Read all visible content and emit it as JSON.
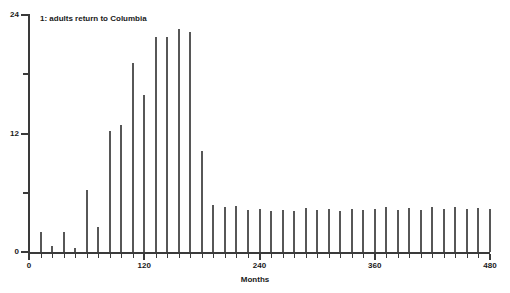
{
  "chart_data": {
    "type": "bar",
    "title": "",
    "annotation": "1: adults return to Columbia",
    "xlabel": "Months",
    "ylabel": "",
    "xlim": [
      0,
      480
    ],
    "ylim": [
      0,
      24
    ],
    "grid": false,
    "legend": null,
    "bar_color": "#575757",
    "axis_color": "#3a3a3a",
    "xticks": [
      0,
      120,
      240,
      360,
      480
    ],
    "xtick_labels": [
      "0",
      "120",
      "240",
      "360",
      "480"
    ],
    "xminor_tick_interval": 12,
    "yticks": [
      0,
      12,
      24
    ],
    "ytick_labels": [
      "0",
      "12",
      "24"
    ],
    "yminor_ticks": [
      6,
      18
    ],
    "x": [
      12,
      24,
      36,
      48,
      60,
      72,
      84,
      96,
      108,
      120,
      132,
      144,
      156,
      168,
      180,
      192,
      204,
      216,
      228,
      240,
      252,
      264,
      276,
      288,
      300,
      312,
      324,
      336,
      348,
      360,
      372,
      384,
      396,
      408,
      420,
      432,
      444,
      456,
      468,
      480
    ],
    "values": [
      2.0,
      0.6,
      2.0,
      0.4,
      6.3,
      2.5,
      12.3,
      12.9,
      19.1,
      15.9,
      21.8,
      21.8,
      22.6,
      22.3,
      10.2,
      4.8,
      4.6,
      4.7,
      4.3,
      4.4,
      4.2,
      4.3,
      4.2,
      4.5,
      4.3,
      4.4,
      4.2,
      4.4,
      4.3,
      4.4,
      4.6,
      4.3,
      4.5,
      4.3,
      4.6,
      4.4,
      4.6,
      4.4,
      4.5,
      4.4
    ]
  },
  "axis": {
    "x_title": "Months"
  }
}
